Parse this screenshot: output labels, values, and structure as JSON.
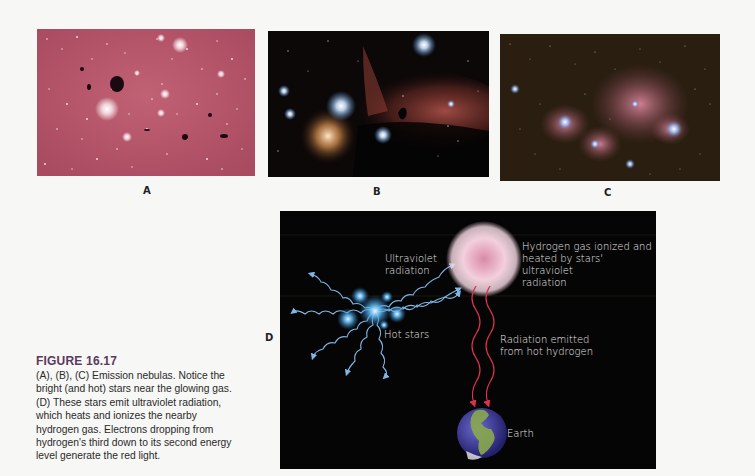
{
  "figure": {
    "number": "FIGURE 16.17",
    "caption": "(A), (B), (C) Emission nebulas. Notice the bright (and hot) stars near the glowing gas. (D) These stars emit ultraviolet radiation, which heats and ionizes the nearby hydrogen gas. Electrons dropping from hydrogen's third down to its second energy level generate the red light.",
    "accent_color": "#5a3a5e"
  },
  "panels": [
    {
      "label": "A",
      "subject": "emission-nebula-pink-starfield",
      "dominant_color": "#b25468"
    },
    {
      "label": "B",
      "subject": "horsehead-and-flame-nebula",
      "dominant_color": "#1a0f0c"
    },
    {
      "label": "C",
      "subject": "emission-nebula-dense-starfield",
      "dominant_color": "#2a1e12"
    },
    {
      "label": "D",
      "subject": "emission-nebula-diagram"
    }
  ],
  "diagram": {
    "labels": {
      "ultraviolet": "Ultraviolet\nradiation",
      "hydrogen": "Hydrogen gas ionized and\nheated by stars' ultraviolet\nradiation",
      "hot_stars": "Hot stars",
      "radiation_emitted": "Radiation emitted\nfrom hot hydrogen",
      "earth": "Earth"
    },
    "colors": {
      "uv_rays": "#7fb6e6",
      "red_rays": "#e0304e",
      "gas_cloud": "#f0c6d6",
      "background": "#050505"
    }
  }
}
